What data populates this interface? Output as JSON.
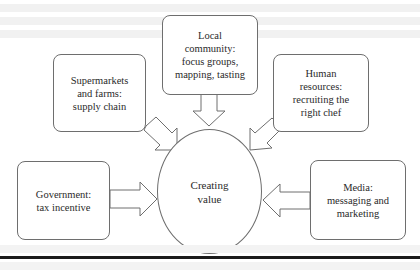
{
  "diagram": {
    "type": "hub-and-spoke",
    "center": {
      "label": "Creating\nvalue"
    },
    "nodes": [
      {
        "id": "local-community",
        "label": "Local\ncommunity:\nfocus groups,\nmapping, tasting",
        "position": "top"
      },
      {
        "id": "supermarkets-farms",
        "label": "Supermarkets\nand farms:\nsupply chain",
        "position": "upper-left"
      },
      {
        "id": "human-resources",
        "label": "Human\nresources:\nrecruiting the\nright chef",
        "position": "upper-right"
      },
      {
        "id": "government",
        "label": "Government:\ntax incentive",
        "position": "left"
      },
      {
        "id": "media",
        "label": "Media:\nmessaging and\nmarketing",
        "position": "right"
      }
    ],
    "edges": [
      {
        "from": "local-community",
        "to": "center",
        "style": "block-arrow"
      },
      {
        "from": "supermarkets-farms",
        "to": "center",
        "style": "block-arrow"
      },
      {
        "from": "human-resources",
        "to": "center",
        "style": "block-arrow"
      },
      {
        "from": "government",
        "to": "center",
        "style": "block-arrow"
      },
      {
        "from": "media",
        "to": "center",
        "style": "block-arrow"
      }
    ],
    "colors": {
      "stroke": "#6e6e6e",
      "text": "#2a2a2a",
      "rule": "#1a1a1a"
    }
  }
}
